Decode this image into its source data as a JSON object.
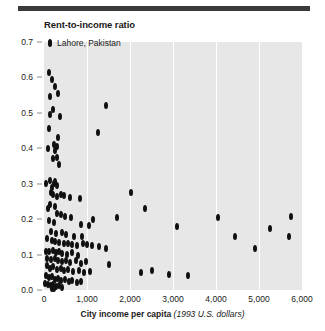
{
  "chart_data": {
    "type": "scatter",
    "title": "Rent-to-income ratio",
    "xlabel_bold": "City income per capita",
    "xlabel_italic": "(1993 U.S. dollars)",
    "ylabel": "Rent-to-income ratio",
    "xlim": [
      0,
      6000
    ],
    "ylim": [
      0.0,
      0.7
    ],
    "grid": "vertical-only",
    "legend_position": "top-left-inside",
    "legend": [
      {
        "name": "Lahore, Pakistan",
        "marker": "diamond",
        "color": "#101010"
      }
    ],
    "x_ticks": [
      0,
      1000,
      2000,
      3000,
      4000,
      5000,
      6000
    ],
    "x_tick_labels": [
      "0",
      "1,000",
      "2,000",
      "3,000",
      "4,000",
      "5,000",
      "6,000"
    ],
    "y_ticks": [
      0.0,
      0.1,
      0.2,
      0.3,
      0.4,
      0.5,
      0.6,
      0.7
    ],
    "y_tick_labels": [
      "0.0",
      "0.1",
      "0.2",
      "0.3",
      "0.4",
      "0.5",
      "0.6",
      "0.7"
    ],
    "highlight_point": {
      "label": "Lahore, Pakistan",
      "x": 130,
      "y": 0.7
    },
    "points": [
      [
        130,
        0.7
      ],
      [
        110,
        0.615
      ],
      [
        175,
        0.595
      ],
      [
        250,
        0.575
      ],
      [
        150,
        0.545
      ],
      [
        330,
        0.555
      ],
      [
        200,
        0.51
      ],
      [
        1450,
        0.52
      ],
      [
        130,
        0.495
      ],
      [
        365,
        0.49
      ],
      [
        120,
        0.455
      ],
      [
        1250,
        0.445
      ],
      [
        335,
        0.43
      ],
      [
        230,
        0.41
      ],
      [
        300,
        0.405
      ],
      [
        90,
        0.4
      ],
      [
        250,
        0.395
      ],
      [
        300,
        0.375
      ],
      [
        215,
        0.37
      ],
      [
        360,
        0.355
      ],
      [
        40,
        0.3
      ],
      [
        150,
        0.31
      ],
      [
        230,
        0.3
      ],
      [
        265,
        0.305
      ],
      [
        300,
        0.295
      ],
      [
        190,
        0.29
      ],
      [
        170,
        0.275
      ],
      [
        220,
        0.27
      ],
      [
        300,
        0.265
      ],
      [
        390,
        0.27
      ],
      [
        460,
        0.268
      ],
      [
        600,
        0.262
      ],
      [
        840,
        0.258
      ],
      [
        2030,
        0.275
      ],
      [
        150,
        0.24
      ],
      [
        250,
        0.235
      ],
      [
        85,
        0.23
      ],
      [
        2350,
        0.23
      ],
      [
        310,
        0.215
      ],
      [
        400,
        0.212
      ],
      [
        480,
        0.208
      ],
      [
        620,
        0.205
      ],
      [
        1150,
        0.2
      ],
      [
        1700,
        0.205
      ],
      [
        4050,
        0.205
      ],
      [
        5750,
        0.208
      ],
      [
        120,
        0.195
      ],
      [
        230,
        0.19
      ],
      [
        870,
        0.185
      ],
      [
        1050,
        0.183
      ],
      [
        3100,
        0.18
      ],
      [
        5250,
        0.175
      ],
      [
        160,
        0.165
      ],
      [
        290,
        0.16
      ],
      [
        420,
        0.162
      ],
      [
        500,
        0.158
      ],
      [
        700,
        0.152
      ],
      [
        880,
        0.15
      ],
      [
        4450,
        0.152
      ],
      [
        5700,
        0.15
      ],
      [
        60,
        0.145
      ],
      [
        175,
        0.14
      ],
      [
        265,
        0.138
      ],
      [
        360,
        0.135
      ],
      [
        470,
        0.13
      ],
      [
        560,
        0.132
      ],
      [
        640,
        0.128
      ],
      [
        760,
        0.125
      ],
      [
        900,
        0.13
      ],
      [
        1000,
        0.128
      ],
      [
        1120,
        0.125
      ],
      [
        1280,
        0.122
      ],
      [
        40,
        0.11
      ],
      [
        120,
        0.108
      ],
      [
        200,
        0.112
      ],
      [
        290,
        0.105
      ],
      [
        350,
        0.108
      ],
      [
        430,
        0.102
      ],
      [
        540,
        0.1
      ],
      [
        660,
        0.105
      ],
      [
        790,
        0.098
      ],
      [
        1450,
        0.118
      ],
      [
        4900,
        0.118
      ],
      [
        80,
        0.09
      ],
      [
        170,
        0.086
      ],
      [
        260,
        0.088
      ],
      [
        330,
        0.082
      ],
      [
        410,
        0.08
      ],
      [
        520,
        0.084
      ],
      [
        610,
        0.078
      ],
      [
        740,
        0.082
      ],
      [
        860,
        0.076
      ],
      [
        980,
        0.08
      ],
      [
        1500,
        0.072
      ],
      [
        60,
        0.068
      ],
      [
        140,
        0.062
      ],
      [
        220,
        0.065
      ],
      [
        300,
        0.058
      ],
      [
        390,
        0.06
      ],
      [
        470,
        0.055
      ],
      [
        560,
        0.058
      ],
      [
        680,
        0.052
      ],
      [
        810,
        0.055
      ],
      [
        930,
        0.05
      ],
      [
        1070,
        0.052
      ],
      [
        2250,
        0.048
      ],
      [
        2500,
        0.055
      ],
      [
        2900,
        0.045
      ],
      [
        3350,
        0.04
      ],
      [
        50,
        0.04
      ],
      [
        120,
        0.035
      ],
      [
        190,
        0.038
      ],
      [
        250,
        0.03
      ],
      [
        320,
        0.032
      ],
      [
        400,
        0.028
      ],
      [
        480,
        0.03
      ],
      [
        570,
        0.025
      ],
      [
        660,
        0.028
      ],
      [
        760,
        0.022
      ],
      [
        870,
        0.025
      ],
      [
        30,
        0.018
      ],
      [
        100,
        0.015
      ],
      [
        160,
        0.012
      ],
      [
        210,
        0.016
      ],
      [
        280,
        0.01
      ],
      [
        350,
        0.013
      ],
      [
        430,
        0.008
      ],
      [
        180,
        0.005
      ],
      [
        240,
        0.004
      ]
    ]
  }
}
